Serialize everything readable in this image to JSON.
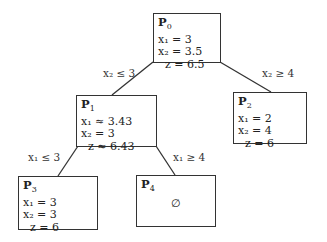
{
  "diagram": {
    "type": "branch-and-bound tree",
    "nodes": [
      {
        "id": "P0",
        "title": "P",
        "sub": "0",
        "lines": [
          "x₁ = 3",
          "x₂ = 3.5",
          "z = 6.5"
        ]
      },
      {
        "id": "P1",
        "title": "P",
        "sub": "1",
        "lines": [
          "x₁ ≈ 3.43",
          "x₂ = 3",
          "z ≈ 6.43"
        ]
      },
      {
        "id": "P2",
        "title": "P",
        "sub": "2",
        "lines": [
          "x₁ = 2",
          "x₂ = 4",
          "z = 6"
        ]
      },
      {
        "id": "P3",
        "title": "P",
        "sub": "3",
        "lines": [
          "x₁ = 3",
          "x₂ = 3",
          "z = 6"
        ]
      },
      {
        "id": "P4",
        "title": "P",
        "sub": "4",
        "empty": "∅"
      }
    ],
    "edges": [
      {
        "from": "P0",
        "to": "P1",
        "label": "x₂ ≤ 3"
      },
      {
        "from": "P0",
        "to": "P2",
        "label": "x₂ ≥ 4"
      },
      {
        "from": "P1",
        "to": "P3",
        "label": "x₁ ≤ 3"
      },
      {
        "from": "P1",
        "to": "P4",
        "label": "x₁ ≥ 4"
      }
    ]
  }
}
